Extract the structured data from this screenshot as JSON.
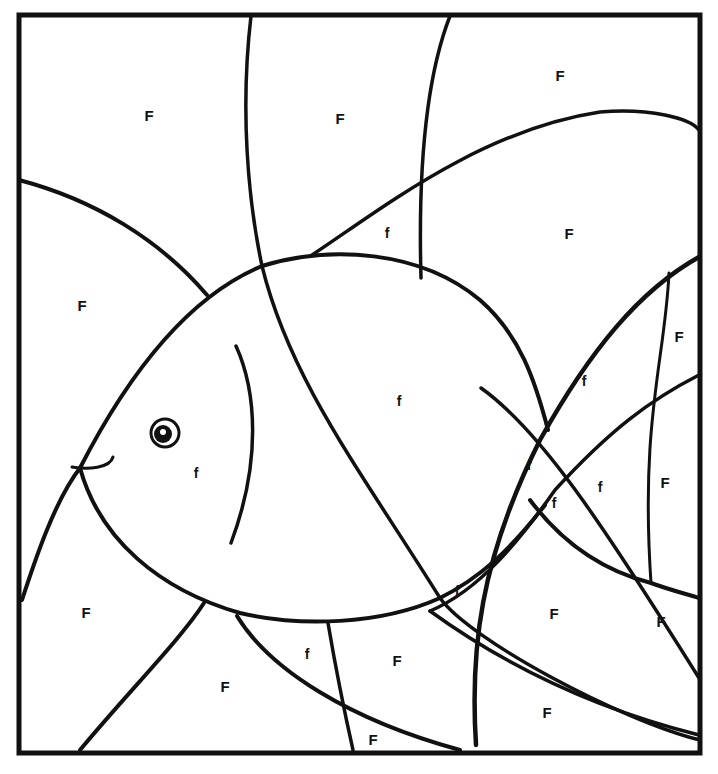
{
  "page": {
    "kind": "coloring-page",
    "line_color": "#111111",
    "background": "#ffffff"
  },
  "frame": {
    "x": 19,
    "y": 15,
    "width": 681,
    "height": 738,
    "stroke": 5
  },
  "curves": [
    {
      "id": "left-arc-upper",
      "d": "M19 180 C 95 200, 160 240, 207 295",
      "w": 4
    },
    {
      "id": "fish-body-top",
      "d": "M80 468 C 120 390, 180 300, 262 266 C 330 245, 420 250, 480 300 C 520 335, 535 380, 548 430",
      "w": 4
    },
    {
      "id": "fish-body-bottom",
      "d": "M80 468 C 100 540, 160 590, 240 613 C 300 627, 380 625, 440 598 C 480 578, 510 550, 545 505",
      "w": 4
    },
    {
      "id": "fish-mouth",
      "d": "M72 467 C 88 470, 110 468, 113 457",
      "w": 3
    },
    {
      "id": "fish-gill",
      "d": "M236 346 C 256 390, 262 460, 231 543",
      "w": 3.5
    },
    {
      "id": "vertical-arc-left",
      "d": "M251 16 C 240 110, 248 200, 262 266 C 290 380, 360 470, 440 598 C 470 640, 620 720, 700 740",
      "w": 3.5
    },
    {
      "id": "vertical-arc-mid",
      "d": "M450 16 C 425 80, 418 170, 421 278",
      "w": 3.5
    },
    {
      "id": "top-wave",
      "d": "M312 255 C 380 210, 480 130, 600 112 C 650 108, 690 118, 699 130",
      "w": 3.5
    },
    {
      "id": "right-fan-outer",
      "d": "M476 745 C 470 650, 480 560, 540 440 C 590 350, 640 290, 699 257",
      "w": 4.5
    },
    {
      "id": "right-fan-inner",
      "d": "M669 273 C 665 360, 640 420, 651 583",
      "w": 3
    },
    {
      "id": "right-wave-mid",
      "d": "M0 0",
      "w": 0
    },
    {
      "id": "x-cross-line",
      "d": "M481 388 C 540 430, 600 520, 699 678",
      "w": 3.5
    },
    {
      "id": "right-wave-2",
      "d": "M430 611 C 480 590, 520 540, 555 490 C 610 430, 650 400, 699 375",
      "w": 3.5
    },
    {
      "id": "tail-fin-bottom",
      "d": "M530 500 C 560 540, 600 570, 651 583 C 670 590, 690 595, 699 598",
      "w": 4
    },
    {
      "id": "cross-diag-lower",
      "d": "M430 611 C 470 640, 560 700, 699 735",
      "w": 3.5
    },
    {
      "id": "lower-left-arc",
      "d": "M80 750 C 130 690, 180 640, 204 603",
      "w": 4
    },
    {
      "id": "lower-fan-left",
      "d": "M237 616 C 270 670, 350 720, 460 750",
      "w": 4
    },
    {
      "id": "lower-vert-mid",
      "d": "M328 623 C 336 670, 344 710, 353 750",
      "w": 3.5
    },
    {
      "id": "left-edge-arc",
      "d": "M22 600 C 35 560, 55 500, 80 468",
      "w": 4
    }
  ],
  "eye": {
    "cx": 165,
    "cy": 433,
    "r_outer": 14,
    "r_iris": 9,
    "highlight": {
      "cx": 163,
      "cy": 432,
      "r": 3
    }
  },
  "labels": [
    {
      "text": "F",
      "x": 149,
      "y": 121,
      "size": 15
    },
    {
      "text": "F",
      "x": 340,
      "y": 124,
      "size": 15
    },
    {
      "text": "F",
      "x": 560,
      "y": 81,
      "size": 15
    },
    {
      "text": "f",
      "x": 387,
      "y": 238,
      "size": 14
    },
    {
      "text": "F",
      "x": 569,
      "y": 239,
      "size": 15
    },
    {
      "text": "F",
      "x": 82,
      "y": 311,
      "size": 15
    },
    {
      "text": "F",
      "x": 679,
      "y": 342,
      "size": 15
    },
    {
      "text": "f",
      "x": 399,
      "y": 406,
      "size": 14
    },
    {
      "text": "f",
      "x": 584,
      "y": 386,
      "size": 14
    },
    {
      "text": "f",
      "x": 196,
      "y": 478,
      "size": 14
    },
    {
      "text": "f",
      "x": 529,
      "y": 470,
      "size": 14
    },
    {
      "text": "f",
      "x": 554,
      "y": 508,
      "size": 14
    },
    {
      "text": "f",
      "x": 600,
      "y": 492,
      "size": 14
    },
    {
      "text": "F",
      "x": 665,
      "y": 488,
      "size": 15
    },
    {
      "text": "f",
      "x": 457,
      "y": 596,
      "size": 14
    },
    {
      "text": "F",
      "x": 86,
      "y": 618,
      "size": 15
    },
    {
      "text": "F",
      "x": 554,
      "y": 619,
      "size": 15
    },
    {
      "text": "F",
      "x": 661,
      "y": 627,
      "size": 15
    },
    {
      "text": "f",
      "x": 307,
      "y": 659,
      "size": 14
    },
    {
      "text": "F",
      "x": 397,
      "y": 666,
      "size": 15
    },
    {
      "text": "F",
      "x": 225,
      "y": 692,
      "size": 15
    },
    {
      "text": "F",
      "x": 547,
      "y": 718,
      "size": 15
    },
    {
      "text": "F",
      "x": 373,
      "y": 745,
      "size": 15
    }
  ]
}
